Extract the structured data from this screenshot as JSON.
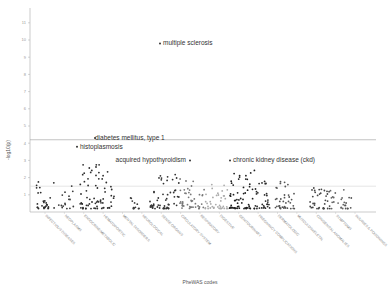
{
  "chart_data": {
    "type": "scatter",
    "title": "",
    "xlabel": "PheWAS codes",
    "ylabel": "-log10(p)",
    "ylim": [
      0,
      11.5
    ],
    "yticks": [
      1,
      2,
      3,
      4,
      5,
      6,
      7,
      8,
      9,
      10,
      11
    ],
    "grid": false,
    "legend": "none",
    "thresholds": [
      {
        "name": "bonferroni",
        "value": 4.2,
        "color": "#9a9a9a"
      },
      {
        "name": "nominal",
        "value": 1.5,
        "color": "#cfcfcf"
      }
    ],
    "categories": [
      "infectious diseases",
      "neoplasms",
      "endocrine/metabolic",
      "hematopoietic",
      "mental disorders",
      "neurological",
      "sense organs",
      "circulatory system",
      "respiratory",
      "digestive",
      "genitourinary",
      "pregnancy complications",
      "dermatologic",
      "musculoskeletal",
      "congenital anomalies",
      "symptoms",
      "injuries & poisonings"
    ],
    "annotations": [
      {
        "label": "multiple sclerosis",
        "x": 160,
        "y": 9.8
      },
      {
        "label": "diabetes mellitus, type 1",
        "x": 95,
        "y": 4.3
      },
      {
        "label": "histoplasmosis",
        "x": 77,
        "y": 3.8
      },
      {
        "label": "acquired hypothyroidism",
        "x": 190,
        "y": 3.0
      },
      {
        "label": "chronic kidney disease (ckd)",
        "x": 230,
        "y": 3.0
      }
    ],
    "clusters": [
      {
        "category": "infectious diseases",
        "x0": 35,
        "x1": 55,
        "n": 28,
        "max": 1.6,
        "color": "#2b2b2b"
      },
      {
        "category": "neoplasms",
        "x0": 58,
        "x1": 74,
        "n": 16,
        "max": 1.4,
        "color": "#3a3a3a"
      },
      {
        "category": "endocrine/metabolic",
        "x0": 80,
        "x1": 115,
        "n": 70,
        "max": 2.6,
        "color": "#2e2e2e"
      },
      {
        "category": "hematopoietic",
        "x0": 130,
        "x1": 140,
        "n": 12,
        "max": 1.2,
        "color": "#3b3b3b"
      },
      {
        "category": "mental disorders",
        "x0": 150,
        "x1": 180,
        "n": 55,
        "max": 2.0,
        "color": "#333333"
      },
      {
        "category": "neurological",
        "x0": 180,
        "x1": 205,
        "n": 45,
        "max": 1.8,
        "color": "#777777"
      },
      {
        "category": "sense organs",
        "x0": 205,
        "x1": 228,
        "n": 40,
        "max": 1.4,
        "color": "#aaaaaa"
      },
      {
        "category": "circulatory system",
        "x0": 228,
        "x1": 255,
        "n": 60,
        "max": 2.3,
        "color": "#1f1f1f"
      },
      {
        "category": "respiratory",
        "x0": 255,
        "x1": 270,
        "n": 30,
        "max": 1.7,
        "color": "#2a2a2a"
      },
      {
        "category": "digestive",
        "x0": 275,
        "x1": 295,
        "n": 38,
        "max": 1.6,
        "color": "#555555"
      },
      {
        "category": "genitourinary",
        "x0": 310,
        "x1": 330,
        "n": 35,
        "max": 1.3,
        "color": "#444444"
      },
      {
        "category": "pregnancy complications",
        "x0": 330,
        "x1": 345,
        "n": 18,
        "max": 1.2,
        "color": "#666666"
      },
      {
        "category": "dermatologic",
        "x0": 345,
        "x1": 352,
        "n": 8,
        "max": 1.0,
        "color": "#555555"
      }
    ]
  }
}
